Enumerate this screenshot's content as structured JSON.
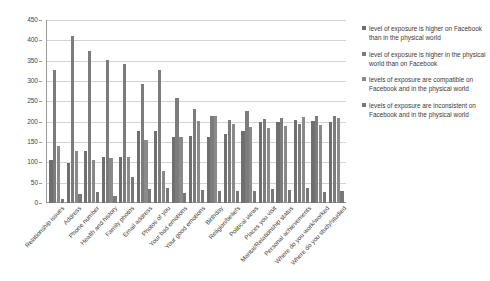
{
  "chart_data": {
    "type": "bar",
    "title": "",
    "subtitle": "",
    "xlabel": "",
    "ylabel": "",
    "ylim": [
      0,
      450
    ],
    "ytick_labels": [
      "0",
      "50",
      "100",
      "150",
      "200",
      "250",
      "300",
      "350",
      "400",
      "450"
    ],
    "ytick_values": [
      0,
      50,
      100,
      150,
      200,
      250,
      300,
      350,
      400,
      450
    ],
    "grid": true,
    "legend_position": "right",
    "categories": [
      "Relationship issues",
      "Address",
      "Phone number",
      "Health and history",
      "Family photos",
      "Email address",
      "Photos of you",
      "Your bad emotions",
      "Your good emotions",
      "Birthday",
      "Religion/beliefs",
      "Political views",
      "Places you visit",
      "Marital/Relationship status",
      "Personal achievements",
      "Where do you work/worked",
      "Where do you study/studied"
    ],
    "series": [
      {
        "name": "level of exposure is higher on Facebook than in the physical world",
        "color": "#6f6f6f",
        "values": [
          105,
          98,
          127,
          112,
          113,
          177,
          176,
          163,
          164,
          163,
          169,
          177,
          199,
          198,
          203,
          201,
          198
        ]
      },
      {
        "name": "level of exposure is higher in the physical world than on Facebook",
        "color": "#7c7c7c",
        "values": [
          327,
          411,
          375,
          351,
          341,
          292,
          328,
          258,
          232,
          213,
          205,
          227,
          206,
          209,
          194,
          215,
          215
        ]
      },
      {
        "name": "levels of exposure are compatible on Facebook and in the physical world",
        "color": "#8a8a8a",
        "values": [
          141,
          127,
          107,
          111,
          113,
          154,
          78,
          163,
          201,
          213,
          194,
          186,
          185,
          190,
          212,
          193,
          208
        ]
      },
      {
        "name": "levels of exposure are inconsistent on Facebook and in the physical world",
        "color": "#787878",
        "values": [
          11,
          23,
          27,
          17,
          63,
          34,
          38,
          25,
          33,
          29,
          30,
          30,
          34,
          32,
          36,
          27,
          30
        ]
      }
    ]
  },
  "legend": {
    "items": [
      {
        "label": "level of exposure is higher on Facebook than in the physical world"
      },
      {
        "label": "level of exposure is higher in the physical world than on Facebook"
      },
      {
        "label": "levels of exposure are compatible on Facebook and in the physical world"
      },
      {
        "label": "levels of exposure are inconsistent on Facebook and in the physical world"
      }
    ]
  }
}
